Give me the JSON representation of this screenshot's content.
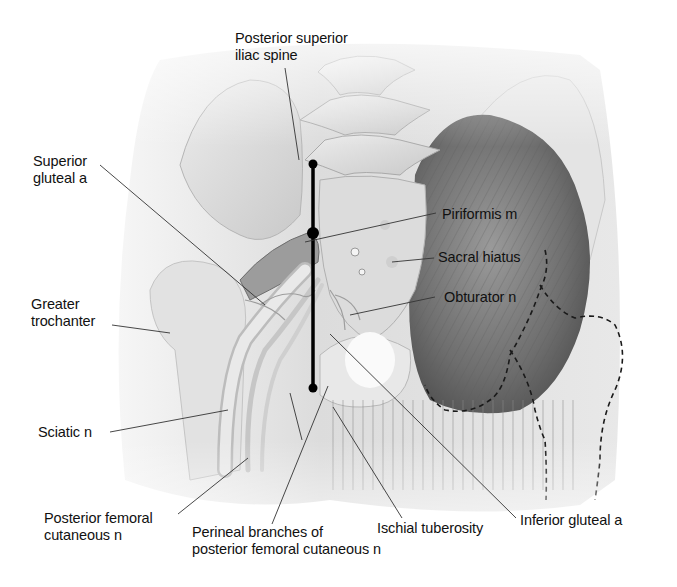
{
  "figure": {
    "type": "anatomical illustration",
    "colors": {
      "skin": "#e6e6e6",
      "bone": "#d4d4d4",
      "muscle": "#8a8a8a",
      "line": "#000000",
      "text": "#111111"
    }
  },
  "labels": {
    "psis": {
      "line1": "Posterior superior",
      "line2": "iliac spine"
    },
    "superior_gluteal": {
      "line1": "Superior",
      "line2": "gluteal a"
    },
    "piriformis": {
      "line1": "Piriformis m"
    },
    "sacral_hiatus": {
      "line1": "Sacral hiatus"
    },
    "obturator": {
      "line1": "Obturator n"
    },
    "greater_trochanter": {
      "line1": "Greater",
      "line2": "trochanter"
    },
    "sciatic": {
      "line1": "Sciatic n"
    },
    "post_fem_cut": {
      "line1": "Posterior femoral",
      "line2": "cutaneous n"
    },
    "perineal": {
      "line1": "Perineal branches of",
      "line2": "posterior femoral cutaneous n"
    },
    "ischial": {
      "line1": "Ischial tuberosity"
    },
    "inferior_gluteal": {
      "line1": "Inferior gluteal a"
    }
  },
  "landmark_line": {
    "points": [
      {
        "name": "psis-point",
        "x": 313,
        "y": 164
      },
      {
        "name": "midpoint",
        "x": 313,
        "y": 233
      },
      {
        "name": "ischial-point",
        "x": 313,
        "y": 388
      }
    ]
  }
}
